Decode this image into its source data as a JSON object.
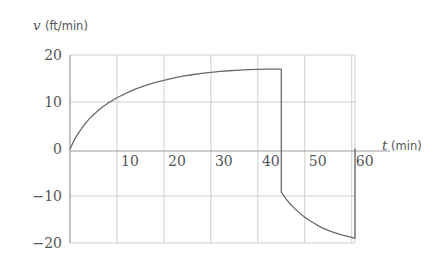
{
  "chart_data": {
    "type": "line",
    "title": "",
    "xlabel": "t (min)",
    "ylabel": "v (ft/min)",
    "x_variable": "t",
    "x_unit": "(min)",
    "y_variable": "v",
    "y_unit": "(ft/min)",
    "xlim": [
      0,
      60.7
    ],
    "ylim": [
      -20,
      20
    ],
    "xticks": [
      10,
      20,
      30,
      40,
      50,
      60
    ],
    "xticklabels": [
      "10",
      "20",
      "30",
      "40",
      "50",
      "60"
    ],
    "yticks": [
      20,
      10,
      0,
      -10,
      -20
    ],
    "yticklabels": [
      "20",
      "10",
      "0",
      "−10",
      "−20"
    ],
    "grid": true,
    "grid_color": "#c9c9c9",
    "legend": "none",
    "series": [
      {
        "name": "velocity",
        "color": "#6b6b6b",
        "linewidth": 1.3,
        "points": [
          [
            0,
            0
          ],
          [
            1,
            2.1
          ],
          [
            2,
            3.7
          ],
          [
            3,
            5.1
          ],
          [
            4,
            6.3
          ],
          [
            5,
            7.3
          ],
          [
            6,
            8.2
          ],
          [
            7,
            9.0
          ],
          [
            8,
            9.7
          ],
          [
            10,
            10.9
          ],
          [
            12,
            11.9
          ],
          [
            14,
            12.8
          ],
          [
            16,
            13.5
          ],
          [
            18,
            14.1
          ],
          [
            20,
            14.6
          ],
          [
            22,
            15.1
          ],
          [
            24,
            15.5
          ],
          [
            26,
            15.8
          ],
          [
            28,
            16.1
          ],
          [
            30,
            16.3
          ],
          [
            32,
            16.5
          ],
          [
            34,
            16.65
          ],
          [
            36,
            16.78
          ],
          [
            38,
            16.88
          ],
          [
            40,
            16.95
          ],
          [
            42,
            17.0
          ],
          [
            44,
            17.0
          ],
          [
            45,
            17.0
          ],
          [
            45,
            -9.2
          ],
          [
            46,
            -10.6
          ],
          [
            47,
            -11.8
          ],
          [
            48,
            -12.8
          ],
          [
            49,
            -13.7
          ],
          [
            50,
            -14.5
          ],
          [
            51,
            -15.2
          ],
          [
            52,
            -15.8
          ],
          [
            53,
            -16.4
          ],
          [
            54,
            -16.9
          ],
          [
            55,
            -17.3
          ],
          [
            56,
            -17.7
          ],
          [
            57,
            -18.0
          ],
          [
            58,
            -18.3
          ],
          [
            59,
            -18.55
          ],
          [
            60,
            -18.8
          ],
          [
            60.7,
            -19.0
          ],
          [
            60.7,
            0
          ]
        ],
        "discontinuities": [
          {
            "t": 45,
            "from": 17.0,
            "to": -9.2
          },
          {
            "t": 60.7,
            "from": -19.0,
            "to": 0
          }
        ],
        "peak": {
          "t": 45,
          "v": 17.0
        },
        "minimum": {
          "t": 60.7,
          "v": -19.0
        },
        "start": {
          "t": 0,
          "v": 0
        }
      }
    ]
  },
  "axes": {
    "y_axis_caption": {
      "variable": "v",
      "unit": "(ft/min)"
    },
    "x_axis_caption": {
      "variable": "t",
      "unit": "(min)"
    }
  },
  "colors": {
    "curve": "#6b6b6b",
    "grid": "#c9c9c9",
    "axis": "#9a9a9a",
    "text": "#555555",
    "background": "#ffffff"
  }
}
